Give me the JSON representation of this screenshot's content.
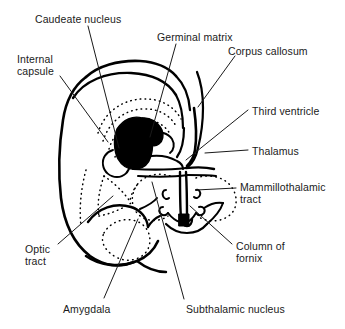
{
  "figure": {
    "background_color": "#ffffff",
    "ink_color": "#000000",
    "text_color": "#1a1a1a",
    "width": 345,
    "height": 329
  },
  "labels": [
    {
      "id": "caudeate-nucleus",
      "text": "Caudeate nucleus",
      "x": 35,
      "y": 13,
      "align": "left"
    },
    {
      "id": "germinal-matrix",
      "text": "Germinal matrix",
      "x": 157,
      "y": 31,
      "align": "left"
    },
    {
      "id": "corpus-callosum",
      "text": "Corpus callosum",
      "x": 228,
      "y": 45,
      "align": "left"
    },
    {
      "id": "internal-capsule",
      "text": "Internal\ncapsule",
      "x": 17,
      "y": 53,
      "align": "left"
    },
    {
      "id": "third-ventricle",
      "text": "Third ventricle",
      "x": 252,
      "y": 105,
      "align": "left"
    },
    {
      "id": "thalamus",
      "text": "Thalamus",
      "x": 252,
      "y": 145,
      "align": "left"
    },
    {
      "id": "mammillothalamic-tract",
      "text": "Mammillothalamic\ntract",
      "x": 240,
      "y": 181,
      "align": "left"
    },
    {
      "id": "column-of-fornix",
      "text": "Column of\nfornix",
      "x": 236,
      "y": 240,
      "align": "left"
    },
    {
      "id": "optic-tract",
      "text": "Optic\ntract",
      "x": 25,
      "y": 243,
      "align": "left"
    },
    {
      "id": "amygdala",
      "text": "Amygdala",
      "x": 63,
      "y": 303,
      "align": "left"
    },
    {
      "id": "subthalamic-nucleus",
      "text": "Subthalamic nucleus",
      "x": 186,
      "y": 303,
      "align": "left"
    }
  ],
  "leader_lines": [
    {
      "id": "leader-caudeate-nucleus",
      "path": "M 88 26 L 119 148"
    },
    {
      "id": "leader-germinal-matrix",
      "path": "M 176 44 L 150 137"
    },
    {
      "id": "leader-corpus-callosum",
      "path": "M 235 56 L 198 107"
    },
    {
      "id": "leader-internal-capsule",
      "path": "M 60 76 L 108 142"
    },
    {
      "id": "leader-third-ventricle",
      "path": "M 248 110 L 186 160"
    },
    {
      "id": "leader-thalamus",
      "path": "M 248 150 L 205 153"
    },
    {
      "id": "leader-mammillothalamic-tract",
      "path": "M 236 188 L 196 190"
    },
    {
      "id": "leader-column-of-fornix",
      "path": "M 232 244 L 190 206"
    },
    {
      "id": "leader-optic-tract",
      "path": "M 58 244 L 113 196"
    },
    {
      "id": "leader-amygdala",
      "path": "M 104 298 L 138 219"
    },
    {
      "id": "leader-subthalamic-nucleus",
      "path": "M 184 299 L 152 182"
    }
  ],
  "structures": [
    {
      "id": "germinal-matrix-region",
      "description": "solid black region"
    },
    {
      "id": "hemisphere-outline",
      "description": "outer brain contour"
    },
    {
      "id": "third-ventricle-midline",
      "description": "vertical midline cleft"
    },
    {
      "id": "corpus-callosum-band",
      "description": "upper curved band"
    },
    {
      "id": "thalamus-region",
      "description": "stippled oval"
    },
    {
      "id": "amygdala-region",
      "description": "stippled oval lower left"
    },
    {
      "id": "optic-tract-band",
      "description": "curved lower-left band"
    }
  ]
}
